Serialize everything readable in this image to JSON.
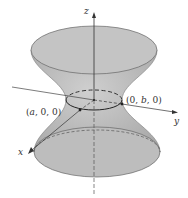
{
  "figure": {
    "axes": {
      "x": "x",
      "y": "y",
      "z": "z"
    },
    "points": {
      "a_point": {
        "open": "(",
        "var": "a",
        "rest": ", 0, 0)"
      },
      "b_point": {
        "open": "(0, ",
        "var": "b",
        "rest": ", 0)"
      }
    },
    "colors": {
      "surface": "#b5b5b5",
      "top_cap": "#c2c2c2",
      "bottom_cap": "#bdbdbd",
      "stroke": "#555555"
    }
  }
}
